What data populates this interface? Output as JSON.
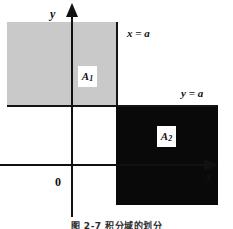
{
  "figure": {
    "caption": "图 2-7    积分域的划分",
    "axes": {
      "x_label": "x",
      "y_label": "y",
      "origin_label": "0"
    },
    "boundaries": [
      {
        "name": "vertical-boundary",
        "label": "x = a"
      },
      {
        "name": "horizontal-boundary",
        "label": "y = a"
      }
    ],
    "regions": [
      {
        "name": "A1",
        "label": "A",
        "subscript": "1",
        "fill": "#c9c9c9"
      },
      {
        "name": "A2",
        "label": "A",
        "subscript": "2",
        "fill": "#090909"
      }
    ]
  }
}
